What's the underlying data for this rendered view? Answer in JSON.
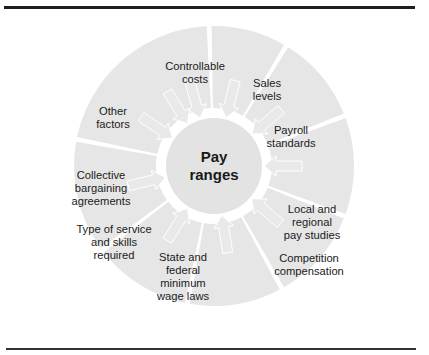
{
  "diagram": {
    "center": {
      "line1": "Pay",
      "line2": "ranges"
    },
    "factors": [
      {
        "id": "controllable-costs",
        "lines": [
          "Controllable",
          "costs"
        ]
      },
      {
        "id": "sales-levels",
        "lines": [
          "Sales",
          "levels"
        ]
      },
      {
        "id": "payroll-standards",
        "lines": [
          "Payroll",
          "standards"
        ]
      },
      {
        "id": "local-regional-pay-studies",
        "lines": [
          "Local and",
          "regional",
          "pay studies"
        ]
      },
      {
        "id": "competition-compensation",
        "lines": [
          "Competition",
          "compensation"
        ]
      },
      {
        "id": "state-federal-minimum-wage",
        "lines": [
          "State and",
          "federal",
          "minimum",
          "wage laws"
        ]
      },
      {
        "id": "type-of-service-skills",
        "lines": [
          "Type of service",
          "and skills",
          "required"
        ]
      },
      {
        "id": "collective-bargaining",
        "lines": [
          "Collective",
          "bargaining",
          "agreements"
        ]
      },
      {
        "id": "other-factors",
        "lines": [
          "Other",
          "factors"
        ]
      }
    ],
    "colors": {
      "wedge": "#e6e6e6",
      "center": "#e3e3e3",
      "text": "#1a1a1a",
      "rule": "#1e1e1e"
    }
  }
}
